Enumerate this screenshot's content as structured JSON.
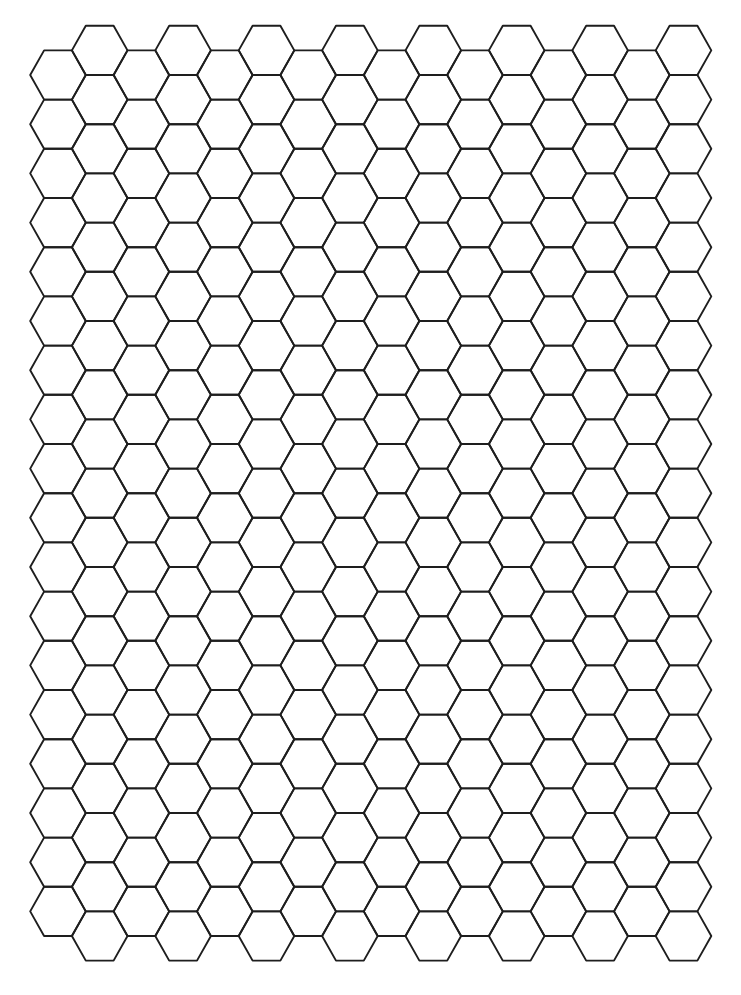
{
  "page": {
    "background": "#ffffff"
  },
  "grid": {
    "orientation": "flat-top",
    "columns": 16,
    "rows_even_columns": 18,
    "rows_odd_columns": 19,
    "origin_x": 58,
    "origin_y_even": 75,
    "origin_y_odd": 50.4,
    "col_spacing": 41.7,
    "row_spacing": 49.2,
    "radius_x": 27.8,
    "half_height": 24.6,
    "stroke": "#1e1e1e",
    "stroke_width": 1.9
  }
}
